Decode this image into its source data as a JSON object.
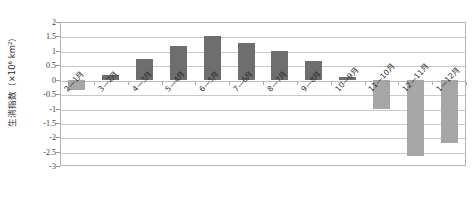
{
  "chart_data": {
    "type": "bar",
    "title": "",
    "subtitle": "",
    "xlabel": "",
    "ylabel": "生消指数（×10⁶ km²）",
    "categories": [
      "2—1月",
      "3—2月",
      "4—3月",
      "5—4月",
      "6—5月",
      "7—6月",
      "8—7月",
      "9—8月",
      "10—9月",
      "11—10月",
      "12—11月",
      "1—12月"
    ],
    "values": [
      -0.35,
      0.15,
      0.7,
      1.15,
      1.5,
      1.25,
      1.0,
      0.65,
      0.1,
      -1.0,
      -2.65,
      -2.2
    ],
    "ylim": [
      -3,
      2
    ],
    "ytick_labels": [
      "2",
      "1.5",
      "1",
      "0.5",
      "0",
      "-0.5",
      "-1",
      "-1.5",
      "-2",
      "-2.5",
      "-3"
    ],
    "ytick_values": [
      2,
      1.5,
      1,
      0.5,
      0,
      -0.5,
      -1,
      -1.5,
      -2,
      -2.5,
      -3
    ],
    "grid": true,
    "legend": false,
    "legend_position": "none",
    "colors": {
      "positive_bar": "#6e6e6e",
      "negative_bar": "#a6a6a6",
      "gridline": "#c9c9c9",
      "frame": "#b4b4b4",
      "text": "#2b2b2b",
      "background": "#ffffff"
    }
  }
}
